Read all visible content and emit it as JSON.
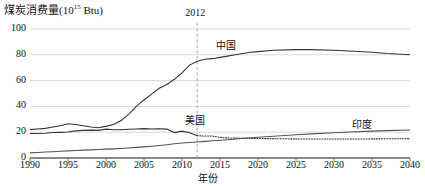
{
  "chart_data": {
    "type": "line",
    "title": "",
    "ylabel": "煤炭消费量(10",
    "ylabel_exponent": "15",
    "ylabel_unit": " Btu)",
    "xlabel": "年份",
    "xlim": [
      1990,
      2040
    ],
    "ylim": [
      0,
      100
    ],
    "grid": true,
    "legend_position": "inline-labels",
    "yticks": [
      "0",
      "20",
      "40",
      "60",
      "80",
      "100"
    ],
    "ytick_values": [
      0,
      20,
      40,
      60,
      80,
      100
    ],
    "xticks": [
      "1990",
      "1995",
      "2000",
      "2005",
      "2010",
      "2015",
      "2020",
      "2025",
      "2030",
      "2035",
      "2040"
    ],
    "xtick_values": [
      1990,
      1995,
      2000,
      2005,
      2010,
      2015,
      2020,
      2025,
      2030,
      2035,
      2040
    ],
    "annotations": [
      {
        "text": "2012",
        "x": 2012,
        "type": "vertical-dashed-line",
        "color": "#9a9a9a"
      }
    ],
    "x": [
      1990,
      1991,
      1992,
      1993,
      1994,
      1995,
      1996,
      1997,
      1998,
      1999,
      2000,
      2001,
      2002,
      2003,
      2004,
      2005,
      2006,
      2007,
      2008,
      2009,
      2010,
      2011,
      2012,
      2013,
      2014,
      2015,
      2016,
      2017,
      2018,
      2019,
      2020,
      2022,
      2025,
      2027,
      2030,
      2032,
      2035,
      2037,
      2040
    ],
    "series": [
      {
        "name": "中国",
        "label": "中国",
        "color": "#333333",
        "style": "solid",
        "label_x": 2016,
        "label_y": 88,
        "values": [
          22.0,
          22.5,
          23.0,
          24.0,
          25.0,
          26.5,
          26.0,
          25.0,
          24.0,
          23.5,
          24.5,
          26.0,
          29.0,
          34.0,
          40.0,
          45.0,
          49.5,
          54.0,
          57.0,
          61.0,
          66.0,
          72.0,
          75.0,
          76.5,
          77.0,
          78.0,
          79.0,
          80.0,
          81.0,
          82.0,
          82.5,
          83.5,
          84.0,
          84.0,
          83.5,
          83.0,
          82.0,
          81.0,
          80.0
        ]
      },
      {
        "name": "美国",
        "label": "美国",
        "color": "#333333",
        "style": "solid-then-dotted",
        "dotted_from": 2012,
        "label_x": 2012,
        "label_y": 30,
        "values": [
          19.0,
          19.0,
          19.2,
          19.8,
          19.9,
          20.1,
          21.0,
          21.4,
          21.6,
          21.4,
          22.4,
          21.9,
          21.9,
          22.3,
          22.5,
          22.8,
          22.5,
          22.7,
          22.4,
          19.7,
          20.8,
          19.6,
          17.3,
          17.0,
          17.0,
          16.0,
          15.5,
          15.4,
          15.3,
          15.2,
          15.1,
          15.0,
          14.8,
          14.7,
          14.7,
          14.7,
          14.8,
          14.9,
          15.0
        ]
      },
      {
        "name": "印度",
        "label": "印度",
        "color": "#555555",
        "style": "solid",
        "label_x": 2034,
        "label_y": 27,
        "values": [
          4.0,
          4.3,
          4.6,
          4.9,
          5.2,
          5.5,
          5.8,
          6.1,
          6.3,
          6.6,
          6.9,
          7.1,
          7.4,
          7.8,
          8.2,
          8.6,
          9.1,
          9.7,
          10.3,
          11.0,
          11.6,
          12.0,
          12.4,
          12.9,
          13.4,
          13.8,
          14.2,
          14.7,
          15.2,
          15.7,
          16.1,
          16.9,
          18.0,
          18.7,
          19.6,
          20.1,
          20.8,
          21.2,
          21.7
        ]
      }
    ]
  },
  "plot_geometry": {
    "left": 30,
    "right": 410,
    "top": 29,
    "bottom": 158
  }
}
